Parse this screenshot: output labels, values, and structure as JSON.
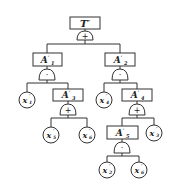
{
  "diagram": {
    "type": "fault-tree",
    "top_event": {
      "label": "T",
      "prime": "′",
      "gate": "+"
    },
    "events": {
      "A1": {
        "label": "A",
        "prime": "′",
        "sub": "1",
        "gate": "·"
      },
      "A2": {
        "label": "A",
        "prime": "′",
        "sub": "2",
        "gate": "·"
      },
      "A3": {
        "label": "A",
        "prime": "′",
        "sub": "3",
        "gate": "+"
      },
      "A4": {
        "label": "A",
        "prime": "′",
        "sub": "4",
        "gate": "+"
      },
      "A5": {
        "label": "A",
        "prime": "′",
        "sub": "5",
        "gate": "·"
      }
    },
    "basic_events": {
      "x1": {
        "label": "x",
        "prime": "′",
        "sub": "1"
      },
      "x4": {
        "label": "x",
        "prime": "′",
        "sub": "4"
      },
      "x5": {
        "label": "x",
        "prime": "′",
        "sub": "5"
      },
      "x6a": {
        "label": "x",
        "prime": "′",
        "sub": "6"
      },
      "x3": {
        "label": "x",
        "prime": "′",
        "sub": "3"
      },
      "x2": {
        "label": "x",
        "prime": "′",
        "sub": "2"
      },
      "x6b": {
        "label": "x",
        "prime": "′",
        "sub": "6"
      }
    },
    "edges": [
      [
        "T",
        "A1"
      ],
      [
        "T",
        "A2"
      ],
      [
        "A1",
        "x1"
      ],
      [
        "A1",
        "A3"
      ],
      [
        "A2",
        "x4"
      ],
      [
        "A2",
        "A4"
      ],
      [
        "A3",
        "x5"
      ],
      [
        "A3",
        "x6a"
      ],
      [
        "A4",
        "A5"
      ],
      [
        "A4",
        "x3"
      ],
      [
        "A5",
        "x2"
      ],
      [
        "A5",
        "x6b"
      ]
    ]
  }
}
